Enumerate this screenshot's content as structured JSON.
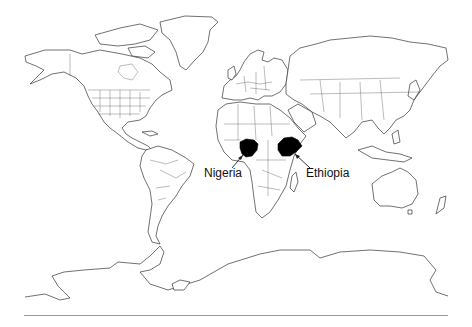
{
  "map": {
    "type": "world political outline map",
    "highlighted_countries": [
      {
        "name": "Nigeria",
        "label": "Nigeria",
        "fill": "#000000"
      },
      {
        "name": "Ethiopia",
        "label": "Ethiopia",
        "fill": "#000000"
      }
    ],
    "outline_color": "#333333",
    "background": "#ffffff",
    "rule_color": "#9a9a9a"
  },
  "labels": {
    "nigeria": "Nigeria",
    "ethiopia": "Ethiopia"
  }
}
